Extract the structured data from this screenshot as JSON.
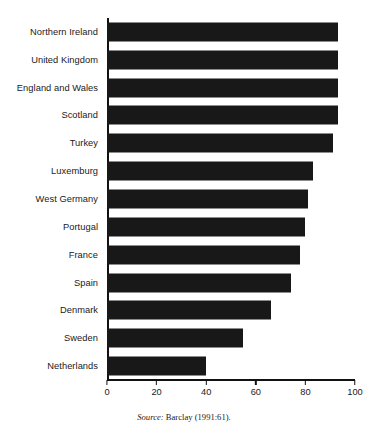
{
  "chart_data": {
    "type": "bar",
    "orientation": "horizontal",
    "title": "",
    "subtitle": "",
    "xlabel": "",
    "ylabel": "",
    "categories": [
      "Northern Ireland",
      "United Kingdom",
      "England and Wales",
      "Scotland",
      "Turkey",
      "Luxemburg",
      "West Germany",
      "Portugal",
      "France",
      "Spain",
      "Denmark",
      "Sweden",
      "Netherlands"
    ],
    "values": [
      93,
      93,
      93,
      93,
      91,
      83,
      81,
      80,
      78,
      74,
      66,
      55,
      40
    ],
    "xlim": [
      0,
      100
    ],
    "xticks": [
      0,
      20,
      40,
      60,
      80,
      100
    ],
    "xtick_labels": [
      "0",
      "20",
      "40",
      "60",
      "80",
      "100"
    ],
    "grid": false,
    "legend": null,
    "bar_color": "#181818",
    "axis_color": "#111111"
  },
  "source": {
    "prefix": "Source:",
    "citation": "Barclay (1991:61)."
  }
}
